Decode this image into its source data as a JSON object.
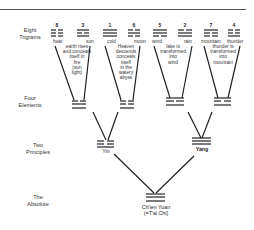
{
  "rows": {
    "trigrams": "Eight\nTrigrams",
    "elements": "Four\nElements",
    "principles": "Two\nPrinciples",
    "absolute": "The\nAbsolute"
  },
  "trigrams": [
    {
      "num": "8",
      "label": "heat",
      "lines": [
        "broken",
        "broken",
        "broken"
      ]
    },
    {
      "num": "3",
      "label": "sun",
      "lines": [
        "solid",
        "broken",
        "solid"
      ]
    },
    {
      "num": "1",
      "label": "cold",
      "lines": [
        "solid",
        "solid",
        "solid"
      ]
    },
    {
      "num": "6",
      "label": "moon",
      "lines": [
        "broken",
        "solid",
        "broken"
      ]
    },
    {
      "num": "5",
      "label": "wind",
      "lines": [
        "solid",
        "solid",
        "broken"
      ]
    },
    {
      "num": "2",
      "label": "rain",
      "lines": [
        "broken",
        "solid",
        "solid"
      ]
    },
    {
      "num": "7",
      "label": "mountain",
      "lines": [
        "solid",
        "broken",
        "broken"
      ]
    },
    {
      "num": "4",
      "label": "thunder",
      "lines": [
        "broken",
        "broken",
        "solid"
      ]
    }
  ],
  "descriptions": [
    "earth rises\nand conceals\nitself in\nfire\n(sun\nlight)",
    "Heaven\ndescends\nconceals\nitself\nin the\nwatery\nabyss",
    "lake is\ntransformed\ninto\nwind",
    "thunder is\ntransformed\ninto\nmountain"
  ],
  "principles": {
    "yin": "Yin",
    "yang": "Yang"
  },
  "absolute": {
    "line1": "Ch'ien Yuan",
    "line2": "(=T'ai Chi)"
  },
  "colors": {
    "ink": "#222222",
    "background": "#ffffff"
  }
}
